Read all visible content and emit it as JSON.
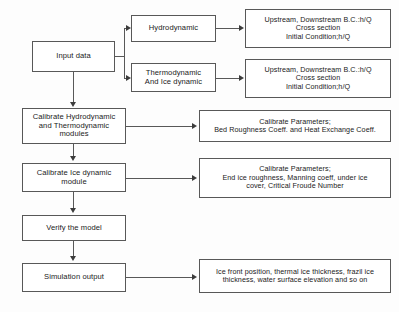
{
  "diagram": {
    "background_color": "#fdfdfd",
    "box_border_color": "#585858",
    "box_fill_color": "#ffffff",
    "connector_color": "#585858"
  },
  "nodes": {
    "input_data": "Input data",
    "hydrodynamic": "Hydrodynamic",
    "thermodynamic": "Thermodynamic\nAnd Ice dynamic",
    "hydro_conditions": "Upstream, Downstream B.C.:h/Q\nCross section\nInitial Condition;h/Q",
    "thermo_conditions": "Upstream, Downstream B.C.:h/Q\nCross section\nInitial Condition;h/Q",
    "calibrate_hydro_thermo": "Calibrate Hydrodynamic\nand Thermodynamic\nmodules",
    "calibrate_params_1": "Calibrate Parameters;\nBed Roughness Coeff. and Heat Exchange Coeff.",
    "calibrate_ice": "Calibrate Ice dynamic\nmodule",
    "calibrate_params_2": "Calibrate Parameters;\nEnd ice roughness, Manning coeff, under ice\ncover, Critical Froude Number",
    "verify_model": "Verify the model",
    "simulation_output": "Simulation output",
    "simulation_results": "Ice front position, thermal ice thickness, frazil ice\nthickness, water surface elevation and so on"
  }
}
